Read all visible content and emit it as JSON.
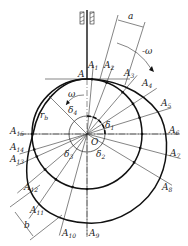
{
  "figure": {
    "center_label": "O",
    "base_radius_label": "r",
    "base_radius_sub": "b",
    "omega_label": "ω",
    "neg_omega_label": "-ω",
    "dim_a_label": "a",
    "dim_b_label": "b",
    "start_point": "A",
    "points": [
      "A1",
      "A2",
      "A3",
      "A4",
      "A5",
      "A6",
      "A7",
      "A8",
      "A9",
      "A10",
      "A11",
      "A12",
      "A13",
      "A14",
      "A15"
    ],
    "angles": [
      {
        "sym": "δ",
        "sub": "1"
      },
      {
        "sym": "δ",
        "sub": "2"
      },
      {
        "sym": "δ",
        "sub": "3"
      },
      {
        "sym": "δ",
        "sub": "4"
      }
    ]
  }
}
